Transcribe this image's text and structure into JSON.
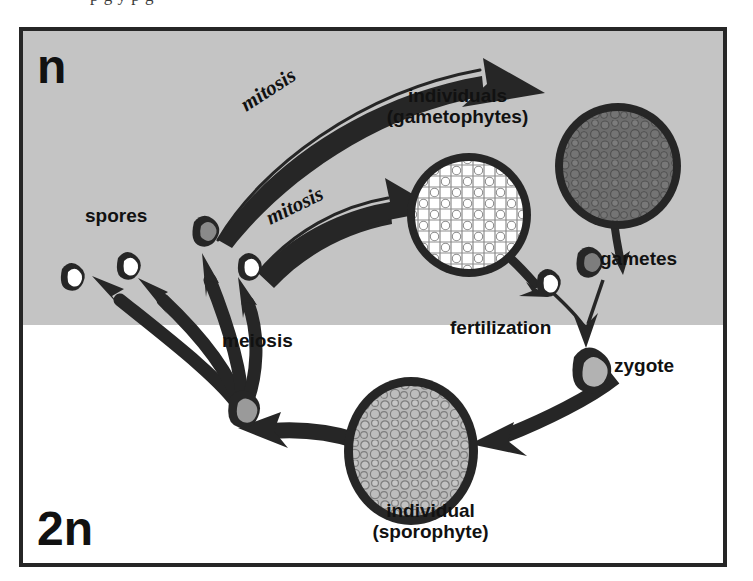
{
  "figure": {
    "title_fragment": "p     g                       y            p               g",
    "ploidy": {
      "haploid_label": "n",
      "diploid_label": "2n"
    },
    "labels": {
      "spores": "spores",
      "gametes": "gametes",
      "zygote": "zygote",
      "fertilization": "fertilization",
      "meiosis": "meiosis",
      "mitosis_upper": "mitosis",
      "mitosis_lower": "mitosis",
      "individuals_gametophytes": "individuals (gametophytes)",
      "individuals_line1": "individuals",
      "individuals_line2": "(gametophytes)",
      "individual_sporophyte": "individual (sporophyte)",
      "individual_line1": "individual",
      "individual_line2": "(sporophyte)"
    },
    "colors": {
      "haploid_background": "#c4c4c4",
      "diploid_background": "#ffffff",
      "ink": "#262626",
      "text": "#111111",
      "gametophyte_light_fill": "#ffffff",
      "gametophyte_dark_fill": "#6e6e6e",
      "sporophyte_fill": "#b9b9b9",
      "cell_outline": "#262626"
    },
    "structures": [
      {
        "name": "spore-1",
        "type": "haploid-cell",
        "fill": "white"
      },
      {
        "name": "spore-2",
        "type": "haploid-cell",
        "fill": "white"
      },
      {
        "name": "spore-3",
        "type": "haploid-cell",
        "fill": "gray"
      },
      {
        "name": "spore-4",
        "type": "haploid-cell",
        "fill": "white"
      },
      {
        "name": "gametophyte-light",
        "type": "multicellular-individual",
        "ploidy": "n",
        "fill": "white"
      },
      {
        "name": "gametophyte-dark",
        "type": "multicellular-individual",
        "ploidy": "n",
        "fill": "dark gray"
      },
      {
        "name": "gamete-white",
        "type": "haploid-cell",
        "fill": "white"
      },
      {
        "name": "gamete-gray",
        "type": "haploid-cell",
        "fill": "gray"
      },
      {
        "name": "zygote",
        "type": "diploid-cell",
        "ploidy": "2n",
        "fill": "gray"
      },
      {
        "name": "sporophyte",
        "type": "multicellular-individual",
        "ploidy": "2n",
        "fill": "gray"
      },
      {
        "name": "meiocyte",
        "type": "diploid-cell",
        "ploidy": "2n",
        "fill": "gray"
      }
    ],
    "processes": [
      {
        "name": "mitosis-to-dark-gametophyte",
        "label": "mitosis",
        "from": "spore-3",
        "to": "gametophyte-dark"
      },
      {
        "name": "mitosis-to-light-gametophyte",
        "label": "mitosis",
        "from": "spore-4",
        "to": "gametophyte-light"
      },
      {
        "name": "gamete-release-light",
        "from": "gametophyte-light",
        "to": "gamete-white"
      },
      {
        "name": "gamete-release-dark",
        "from": "gametophyte-dark",
        "to": "gamete-gray"
      },
      {
        "name": "fertilization",
        "label": "fertilization",
        "from": "gametes",
        "to": "zygote"
      },
      {
        "name": "zygote-growth",
        "from": "zygote",
        "to": "sporophyte"
      },
      {
        "name": "sporophyte-to-meiocyte",
        "from": "sporophyte",
        "to": "meiocyte"
      },
      {
        "name": "meiosis",
        "label": "meiosis",
        "from": "meiocyte",
        "to": "spores",
        "arrow_count": 4
      }
    ]
  }
}
